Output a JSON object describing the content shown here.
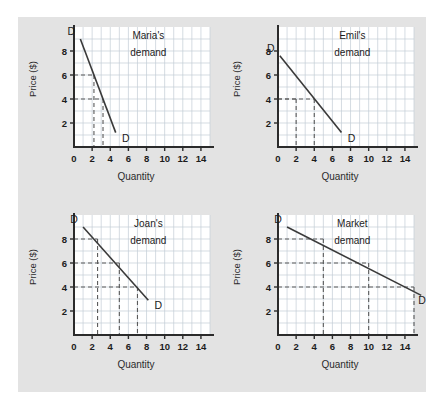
{
  "figure": {
    "background_color": "#ffffff",
    "panel_color": "#e3e3e3",
    "plot_color": "#ffffff",
    "grid_color": "#c3cdd6",
    "axis_color": "#2b2b2b",
    "curve_color": "#3a3a3a",
    "dash_color": "#5a5a5a"
  },
  "charts": [
    {
      "id": "maria",
      "title_line1": "Maria's",
      "title_line2": "demand",
      "xlabel": "Quantity",
      "ylabel": "Price ($)",
      "xticks": [
        "0",
        "2",
        "4",
        "6",
        "8",
        "10",
        "12",
        "14"
      ],
      "yticks": [
        "2",
        "4",
        "6",
        "8"
      ],
      "curve_label_start": "D",
      "curve_label_end": "D",
      "chart_data": {
        "type": "line",
        "title": "Maria's demand",
        "xlabel": "Quantity",
        "ylabel": "Price ($)",
        "xlim": [
          0,
          15
        ],
        "ylim": [
          0,
          10
        ],
        "xticks": [
          0,
          2,
          4,
          6,
          8,
          10,
          12,
          14
        ],
        "yticks": [
          2,
          4,
          6,
          8
        ],
        "grid": true,
        "series": [
          {
            "name": "D",
            "x": [
              0.7,
              4.6
            ],
            "values": [
              9.0,
              1.2
            ]
          }
        ],
        "guides": [
          {
            "price": 6,
            "quantity": 2.2
          },
          {
            "price": 4,
            "quantity": 3.2
          }
        ]
      }
    },
    {
      "id": "emil",
      "title_line1": "Emil's",
      "title_line2": "demand",
      "xlabel": "Quantity",
      "ylabel": "Price ($)",
      "xticks": [
        "0",
        "2",
        "4",
        "6",
        "8",
        "10",
        "12",
        "14"
      ],
      "yticks": [
        "2",
        "4",
        "6",
        "8"
      ],
      "curve_label_start": "D",
      "curve_label_end": "D",
      "chart_data": {
        "type": "line",
        "title": "Emil's demand",
        "xlabel": "Quantity",
        "ylabel": "Price ($)",
        "xlim": [
          0,
          15
        ],
        "ylim": [
          0,
          10
        ],
        "xticks": [
          0,
          2,
          4,
          6,
          8,
          10,
          12,
          14
        ],
        "yticks": [
          2,
          4,
          6,
          8
        ],
        "grid": true,
        "series": [
          {
            "name": "D",
            "x": [
              0.2,
              7.0
            ],
            "values": [
              7.6,
              1.2
            ]
          }
        ],
        "guides": [
          {
            "price": 4,
            "quantity": 2.0
          },
          {
            "price": 4,
            "quantity": 4.0
          }
        ]
      }
    },
    {
      "id": "joan",
      "title_line1": "Joan's",
      "title_line2": "demand",
      "xlabel": "Quantity",
      "ylabel": "Price ($)",
      "xticks": [
        "0",
        "2",
        "4",
        "6",
        "8",
        "10",
        "12",
        "14"
      ],
      "yticks": [
        "2",
        "4",
        "6",
        "8"
      ],
      "curve_label_start": "D",
      "curve_label_end": "D",
      "chart_data": {
        "type": "line",
        "title": "Joan's demand",
        "xlabel": "Quantity",
        "ylabel": "Price ($)",
        "xlim": [
          0,
          15
        ],
        "ylim": [
          0,
          10
        ],
        "xticks": [
          0,
          2,
          4,
          6,
          8,
          10,
          12,
          14
        ],
        "yticks": [
          2,
          4,
          6,
          8
        ],
        "grid": true,
        "series": [
          {
            "name": "D",
            "x": [
              1.0,
              8.2
            ],
            "values": [
              9.0,
              2.9
            ]
          }
        ],
        "guides": [
          {
            "price": 8,
            "quantity": 2.6
          },
          {
            "price": 6,
            "quantity": 5.0
          },
          {
            "price": 4,
            "quantity": 7.0
          }
        ]
      }
    },
    {
      "id": "market",
      "title_line1": "Market",
      "title_line2": "demand",
      "xlabel": "Quantity",
      "ylabel": "Price ($)",
      "xticks": [
        "0",
        "2",
        "4",
        "6",
        "8",
        "10",
        "12",
        "14"
      ],
      "yticks": [
        "2",
        "4",
        "6",
        "8"
      ],
      "curve_label_start": "D",
      "curve_label_end": "D",
      "chart_data": {
        "type": "line",
        "title": "Market demand",
        "xlabel": "Quantity",
        "ylabel": "Price ($)",
        "xlim": [
          0,
          15
        ],
        "ylim": [
          0,
          10
        ],
        "xticks": [
          0,
          2,
          4,
          6,
          8,
          10,
          12,
          14
        ],
        "yticks": [
          2,
          4,
          6,
          8
        ],
        "grid": true,
        "series": [
          {
            "name": "D",
            "x": [
              1.0,
              15.8
            ],
            "values": [
              9.0,
              3.3
            ]
          }
        ],
        "guides": [
          {
            "price": 8,
            "quantity": 5.0
          },
          {
            "price": 6,
            "quantity": 10.0
          },
          {
            "price": 4,
            "quantity": 15.0
          }
        ]
      }
    }
  ]
}
